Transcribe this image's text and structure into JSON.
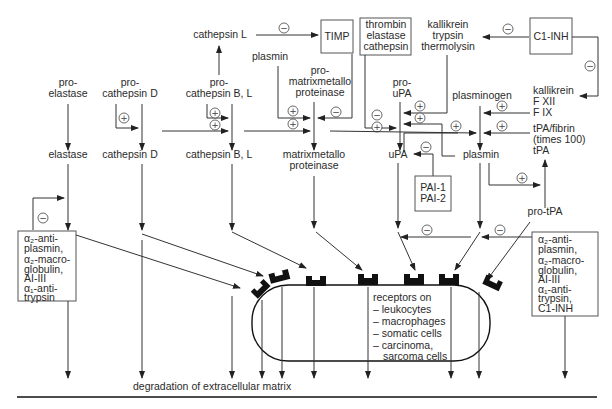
{
  "diagram": {
    "title": "degradation of extracellular matrix",
    "nodes": {
      "cathepsin_L": "cathepsin L",
      "timp": "TIMP",
      "thrombin_box": [
        "thrombin",
        "elastase",
        "cathepsin"
      ],
      "kallikrein_group": [
        "kallikrein",
        "trypsin",
        "thermolysin"
      ],
      "c1_inh": "C1-INH",
      "plasmin_top": "plasmin",
      "pro_elastase": [
        "pro-",
        "elastase"
      ],
      "pro_cathepsin_D": [
        "pro-",
        "cathepsin D"
      ],
      "pro_cathepsin_BL": [
        "pro-",
        "cathepsin B, L"
      ],
      "pro_mmp": [
        "pro-",
        "matrixmetallo",
        "proteinase"
      ],
      "pro_upa": [
        "pro-",
        "uPA"
      ],
      "plasminogen": "plasminogen",
      "kallikrein_f": [
        "kallikrein",
        "F XII",
        "F IX"
      ],
      "tpa_fibrin": [
        "tPA/fibrin",
        "(times 100)",
        "tPA"
      ],
      "elastase": "elastase",
      "cathepsin_D": "cathepsin D",
      "cathepsin_BL": "cathepsin B, L",
      "mmp": [
        "matrixmetallo",
        "proteinase"
      ],
      "upa": "uPA",
      "plasmin": "plasmin",
      "pai": [
        "PAI-1",
        "PAI-2"
      ],
      "pro_tpa": "pro-tPA",
      "inhibitors_left": [
        "α₂-anti-",
        "plasmin,",
        "α₂-macro-",
        "globulin,",
        "AI-III",
        "α₁-anti-",
        "trypsin"
      ],
      "inhibitors_right": [
        "α₂-anti-",
        "plasmin,",
        "α₂-macro-",
        "globulin,",
        "AI-III",
        "α₁-anti-",
        "trypsin,",
        "C1-INH"
      ],
      "receptors": [
        "receptors on",
        "– leukocytes",
        "– macrophages",
        "– somatic cells",
        "– carcinoma,",
        "   sarcoma cells"
      ]
    },
    "signs": {
      "plus": "+",
      "minus": "−"
    },
    "colors": {
      "line": "#333333",
      "text": "#2a2a2a",
      "receptor": "#111111",
      "background": "#ffffff"
    }
  }
}
